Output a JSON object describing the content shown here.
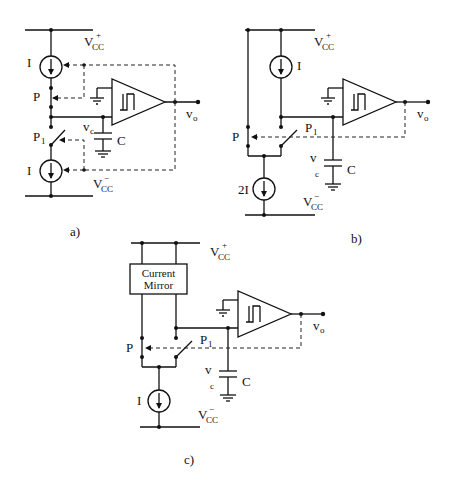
{
  "figure": {
    "panels": [
      {
        "id": "a",
        "caption": "a)",
        "labels": {
          "vcc_pos": "V",
          "vcc_pos_sub": "CC",
          "vcc_pos_sup": "+",
          "vcc_neg": "V",
          "vcc_neg_sub": "CC",
          "vcc_neg_sup": "−",
          "current_top": "I",
          "current_bottom": "I",
          "switch_p": "P",
          "switch_p1": "P",
          "switch_p1_sub": "1",
          "vc": "v",
          "vc_sub": "c",
          "capacitor": "C",
          "vo": "v",
          "vo_sub": "o"
        }
      },
      {
        "id": "b",
        "caption": "b)",
        "labels": {
          "vcc_pos": "V",
          "vcc_pos_sub": "CC",
          "vcc_pos_sup": "+",
          "vcc_neg": "V",
          "vcc_neg_sub": "CC",
          "vcc_neg_sup": "−",
          "current_top": "I",
          "current_bottom": "2I",
          "switch_p": "P",
          "switch_p1": "P",
          "switch_p1_sub": "1",
          "vc": "v",
          "vc_sub": "c",
          "capacitor": "C",
          "vo": "v",
          "vo_sub": "o"
        }
      },
      {
        "id": "c",
        "caption": "c)",
        "labels": {
          "vcc_pos": "V",
          "vcc_pos_sub": "CC",
          "vcc_pos_sup": "+",
          "vcc_neg": "V",
          "vcc_neg_sub": "CC",
          "vcc_neg_sup": "−",
          "mirror_line1": "Current",
          "mirror_line2": "Mirror",
          "current_bottom": "I",
          "switch_p": "P",
          "switch_p1": "P",
          "switch_p1_sub": "1",
          "vc": "v",
          "vc_sub": "c",
          "capacitor": "C",
          "vo": "v",
          "vo_sub": "o"
        }
      }
    ]
  }
}
